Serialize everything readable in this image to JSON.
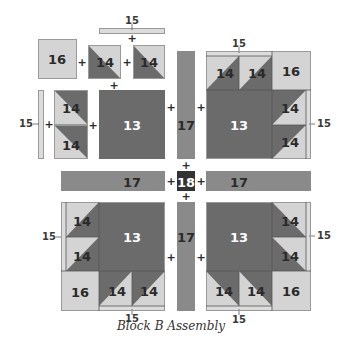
{
  "diagram": {
    "title": "Block B Assembly",
    "colors": {
      "dark": "#6b6b6b",
      "medium": "#8a8a8a",
      "light": "#d4d4d4",
      "strip": "#dcdcdc",
      "center": "#333333",
      "border": "#9a9a9a"
    },
    "operator": "+",
    "pieces": {
      "p13": "13",
      "p14": "14",
      "p15": "15",
      "p16": "16",
      "p17": "17",
      "p18": "18"
    },
    "quadrants": [
      {
        "id": "top-left",
        "layout": "exploded",
        "pieces": [
          "16",
          "14",
          "14",
          "15",
          "15",
          "14",
          "14",
          "13"
        ]
      },
      {
        "id": "top-right",
        "layout": "assembled",
        "pieces": [
          "15",
          "14",
          "14",
          "16",
          "13",
          "14",
          "14",
          "15"
        ]
      },
      {
        "id": "bottom-left",
        "layout": "assembled",
        "pieces": [
          "14",
          "14",
          "13",
          "16",
          "14",
          "14",
          "15",
          "15"
        ]
      },
      {
        "id": "bottom-right",
        "layout": "assembled",
        "pieces": [
          "13",
          "14",
          "14",
          "14",
          "14",
          "16",
          "15",
          "15"
        ]
      }
    ],
    "sashing": {
      "vertical": [
        "17",
        "17"
      ],
      "horizontal": [
        "17",
        "17"
      ],
      "center": "18"
    }
  }
}
